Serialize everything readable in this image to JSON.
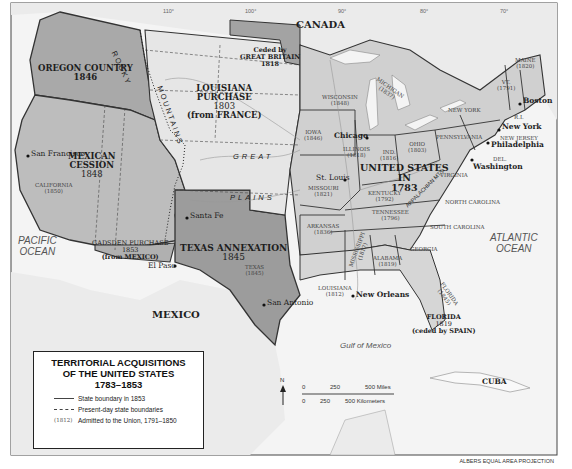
{
  "map": {
    "title_lines": [
      "TERRITORIAL ACQUISITIONS",
      "OF THE UNITED STATES",
      "1783–1853"
    ],
    "projection": "ALBERS EQUAL AREA PROJECTION",
    "legend": {
      "items": [
        {
          "key": "solid-line",
          "label": "State boundary in 1853"
        },
        {
          "key": "dashed-line",
          "label": "Present-day state boundaries"
        },
        {
          "key": "(1812)",
          "label": "Admitted to the Union, 1791–1850"
        }
      ]
    },
    "scale": {
      "miles": [
        "0",
        "250",
        "500 Miles"
      ],
      "kilometers": [
        "0",
        "250",
        "500 Kilometers"
      ]
    },
    "north_arrow": "N",
    "longitudes": [
      "110°",
      "100°",
      "90°",
      "80°",
      "70°"
    ],
    "latitudes": [
      "40°",
      "30°",
      "20°"
    ],
    "countries": {
      "canada": "CANADA",
      "mexico": "MEXICO",
      "cuba": "CUBA"
    },
    "waters": {
      "pacific": [
        "PACIFIC",
        "OCEAN"
      ],
      "atlantic": [
        "ATLANTIC",
        "OCEAN"
      ],
      "gulf": "Gulf of Mexico"
    },
    "physical": {
      "rocky": "ROCKY",
      "mountains": "MOUNTAINS",
      "great": "GREAT",
      "plains": "PLAINS",
      "appalachian": "APPALACHIAN MTS."
    },
    "acquisitions": {
      "us1783": [
        "UNITED STATES",
        "IN",
        "1783"
      ],
      "louisiana": [
        "LOUISIANA",
        "PURCHASE",
        "1803",
        "(from FRANCE)"
      ],
      "britain": [
        "Ceded by",
        "GREAT BRITAIN",
        "1818"
      ],
      "oregon": [
        "OREGON COUNTRY",
        "1846"
      ],
      "mexican_cession": [
        "MEXICAN",
        "CESSION",
        "1848"
      ],
      "gadsden": [
        "GADSDEN PURCHASE",
        "1853",
        "(from MEXICO)"
      ],
      "texas": [
        "TEXAS ANNEXATION",
        "1845"
      ],
      "florida": [
        "FLORIDA",
        "1819",
        "(ceded by SPAIN)"
      ]
    },
    "states": [
      {
        "name": "CALIFORNIA",
        "year": "(1850)"
      },
      {
        "name": "TEXAS",
        "year": "(1845)"
      },
      {
        "name": "IOWA",
        "year": "(1846)"
      },
      {
        "name": "WISCONSIN",
        "year": "(1848)"
      },
      {
        "name": "MICHIGAN",
        "year": "(1837)"
      },
      {
        "name": "ILLINOIS",
        "year": "(1818)"
      },
      {
        "name": "IND.",
        "year": "(1816)"
      },
      {
        "name": "OHIO",
        "year": "(1803)"
      },
      {
        "name": "MISSOURI",
        "year": "(1821)"
      },
      {
        "name": "ARKANSAS",
        "year": "(1836)"
      },
      {
        "name": "KENTUCKY",
        "year": "(1792)"
      },
      {
        "name": "TENNESSEE",
        "year": "(1796)"
      },
      {
        "name": "LOUISIANA",
        "year": "(1812)"
      },
      {
        "name": "MISSISSIPPI",
        "year": "(1817)"
      },
      {
        "name": "ALABAMA",
        "year": "(1819)"
      },
      {
        "name": "FLORIDA",
        "year": "(1845)"
      },
      {
        "name": "MAINE",
        "year": "(1820)"
      },
      {
        "name": "VT.",
        "year": "(1791)"
      },
      {
        "name": "GEORGIA",
        "year": ""
      },
      {
        "name": "SOUTH CAROLINA",
        "year": ""
      },
      {
        "name": "NORTH CAROLINA",
        "year": ""
      },
      {
        "name": "VIRGINIA",
        "year": ""
      },
      {
        "name": "PENNSYLVANIA",
        "year": ""
      },
      {
        "name": "NEW YORK",
        "year": ""
      },
      {
        "name": "NEW JERSEY",
        "year": ""
      },
      {
        "name": "DEL.",
        "year": ""
      },
      {
        "name": "R.I.",
        "year": ""
      }
    ],
    "cities": [
      "San Francisco",
      "Santa Fe",
      "El Paso",
      "San Antonio",
      "New Orleans",
      "St. Louis",
      "Chicago",
      "Washington",
      "Philadelphia",
      "New York",
      "Boston"
    ],
    "rivers": [
      "Yellowstone River",
      "Missouri River",
      "Platte River",
      "Arkansas River",
      "Red River",
      "Mississippi River",
      "Ohio River",
      "Snake River",
      "Columbia River",
      "Colorado River",
      "Rio Grande"
    ],
    "lakes": [
      "Lake Superior",
      "L. Michigan",
      "Huron",
      "Erie",
      "Ontario",
      "Great Salt Lake"
    ],
    "colors": {
      "background": "#ffffff",
      "land_foreign": "#ededed",
      "us1783": "#d0d0d0",
      "louisiana": "#e6e6e6",
      "oregon": "#a9a9a9",
      "cession": "#bababa",
      "texas": "#9c9c9c",
      "britain": "#a3a3a3",
      "florida": "#d6d6d6",
      "water": "#f4f4f4"
    }
  }
}
